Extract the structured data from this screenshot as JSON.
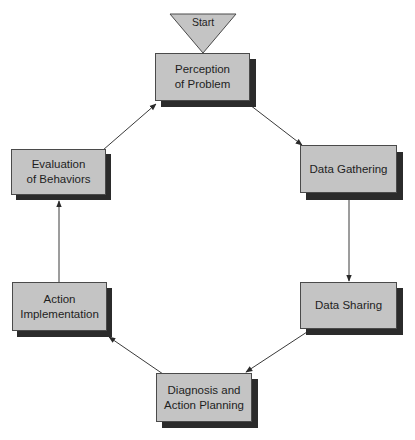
{
  "diagram": {
    "type": "cycle-flowchart",
    "start": {
      "label": "Start"
    },
    "nodes": [
      {
        "id": "perception",
        "label": "Perception\nof Problem"
      },
      {
        "id": "data_gathering",
        "label": "Data Gathering"
      },
      {
        "id": "data_sharing",
        "label": "Data Sharing"
      },
      {
        "id": "diagnosis",
        "label": "Diagnosis and\nAction Planning"
      },
      {
        "id": "action_implementation",
        "label": "Action\nImplementation"
      },
      {
        "id": "evaluation",
        "label": "Evaluation\nof Behaviors"
      }
    ],
    "edges": [
      {
        "from": "start",
        "to": "perception"
      },
      {
        "from": "perception",
        "to": "data_gathering"
      },
      {
        "from": "data_gathering",
        "to": "data_sharing"
      },
      {
        "from": "data_sharing",
        "to": "diagnosis"
      },
      {
        "from": "diagnosis",
        "to": "action_implementation"
      },
      {
        "from": "action_implementation",
        "to": "evaluation"
      },
      {
        "from": "evaluation",
        "to": "perception"
      }
    ],
    "colors": {
      "box_fill": "#c4c4c4",
      "box_shadow": "#2b2b2b",
      "start_fill": "#c4c4c4",
      "line": "#3a3a3a"
    }
  }
}
